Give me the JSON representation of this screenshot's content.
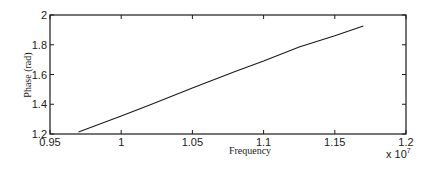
{
  "chart_data": {
    "type": "line",
    "title": "",
    "xlabel": "Frequency",
    "ylabel": "Phase (rad)",
    "x_exponent_label": "x 10",
    "x_exponent_power": "7",
    "xlim": [
      0.95,
      1.2
    ],
    "ylim": [
      1.2,
      2.0
    ],
    "grid": false,
    "legend": null,
    "x_ticks": [
      0.95,
      1.0,
      1.05,
      1.1,
      1.15,
      1.2
    ],
    "x_tick_labels": [
      "0.95",
      "1",
      "1.05",
      "1.1",
      "1.15",
      "1.2"
    ],
    "y_ticks": [
      1.2,
      1.4,
      1.6,
      1.8,
      2.0
    ],
    "y_tick_labels": [
      "1.2",
      "1.4",
      "1.6",
      "1.8",
      "2"
    ],
    "series": [
      {
        "name": "Phase",
        "color": "#1a1a1a",
        "x": [
          0.97,
          1.0,
          1.02,
          1.05,
          1.08,
          1.1,
          1.125,
          1.15,
          1.17
        ],
        "y": [
          1.213,
          1.322,
          1.395,
          1.51,
          1.62,
          1.69,
          1.785,
          1.86,
          1.926
        ]
      }
    ]
  }
}
